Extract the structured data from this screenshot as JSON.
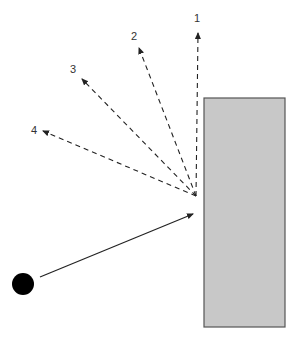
{
  "diagram": {
    "ball": {
      "cx": 23,
      "cy": 284,
      "r": 11,
      "color": "#000000"
    },
    "wall": {
      "x": 204,
      "y": 98,
      "width": 81,
      "height": 229,
      "fill": "#c8c8c8",
      "stroke": "#555555"
    },
    "incident_path": {
      "x1": 40,
      "y1": 277,
      "x2": 193,
      "y2": 214,
      "style": "solid"
    },
    "impact_point": {
      "x": 196,
      "y": 196
    },
    "rebound_paths": [
      {
        "label": "1",
        "x2": 198,
        "y2": 33,
        "label_x": 194,
        "label_y": 12
      },
      {
        "label": "2",
        "x2": 139,
        "y2": 48,
        "label_x": 131,
        "label_y": 30
      },
      {
        "label": "3",
        "x2": 82,
        "y2": 79,
        "label_x": 70,
        "label_y": 63
      },
      {
        "label": "4",
        "x2": 43,
        "y2": 131,
        "label_x": 31,
        "label_y": 124
      }
    ],
    "colors": {
      "line": "#222222",
      "label": "#333333"
    }
  }
}
